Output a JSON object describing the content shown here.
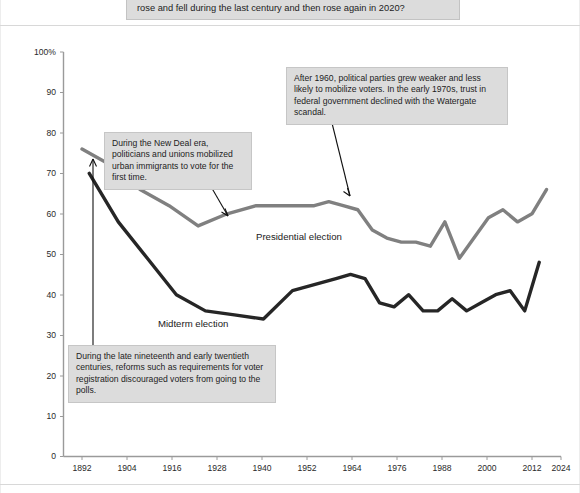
{
  "header": {
    "question": "rose and fell during the last century and then rose again in 2020?"
  },
  "colors": {
    "presidential_line": "#808080",
    "midterm_line": "#262626",
    "axis": "#9a9a9a",
    "callout_background": "#dcdcdc",
    "callout_border": "#c6c6c6",
    "annotation_arrow": "#111111"
  },
  "series_labels": {
    "presidential": "Presidential election",
    "midterm": "Midterm election"
  },
  "annotations": [
    {
      "id": "new-deal",
      "text": "During the New Deal era, politicians and unions mobilized urban immigrants to vote for the first time."
    },
    {
      "id": "parties-weaker",
      "text": "After 1960, political parties grew weaker and less likely to mobilize voters. In the early 1970s, trust in federal government declined with the Watergate scandal."
    },
    {
      "id": "registration-reforms",
      "text": "During the late nineteenth and early twentieth centuries, reforms such as requirements for voter registration discouraged voters from going to the polls."
    }
  ],
  "chart_data": {
    "type": "line",
    "title": "",
    "xlabel": "",
    "ylabel": "",
    "grid": false,
    "legend_position": "inline-labels",
    "xlim": [
      1892,
      2024
    ],
    "ylim": [
      0,
      100
    ],
    "ytick_labels": [
      "0",
      "10",
      "20",
      "30",
      "40",
      "50",
      "60",
      "70",
      "80",
      "90",
      "100%"
    ],
    "ytick_values": [
      0,
      10,
      20,
      30,
      40,
      50,
      60,
      70,
      80,
      90,
      100
    ],
    "xtick_labels": [
      "1892",
      "1904",
      "1916",
      "1928",
      "1940",
      "1952",
      "1964",
      "1976",
      "1988",
      "2000",
      "2012",
      "2024"
    ],
    "xtick_values": [
      1892,
      1904,
      1916,
      1928,
      1940,
      1952,
      1964,
      1976,
      1988,
      2000,
      2012,
      2024
    ],
    "series": [
      {
        "name": "Presidential election",
        "color": "#808080",
        "x": [
          1892,
          1900,
          1908,
          1916,
          1924,
          1932,
          1940,
          1948,
          1956,
          1960,
          1964,
          1968,
          1972,
          1976,
          1980,
          1984,
          1988,
          1992,
          1996,
          2000,
          2004,
          2008,
          2012,
          2016,
          2020
        ],
        "values": [
          76,
          72,
          66,
          62,
          57,
          60,
          62,
          62,
          62,
          63,
          62,
          61,
          56,
          54,
          53,
          53,
          52,
          58,
          49,
          54,
          59,
          61,
          58,
          60,
          66
        ]
      },
      {
        "name": "Midterm election",
        "color": "#262626",
        "x": [
          1894,
          1902,
          1910,
          1918,
          1926,
          1934,
          1942,
          1950,
          1958,
          1962,
          1966,
          1970,
          1974,
          1978,
          1982,
          1986,
          1990,
          1994,
          1998,
          2002,
          2006,
          2010,
          2014,
          2018
        ],
        "values": [
          70,
          58,
          49,
          40,
          36,
          35,
          34,
          41,
          43,
          44,
          45,
          44,
          38,
          37,
          40,
          36,
          36,
          39,
          36,
          38,
          40,
          41,
          36,
          48
        ]
      }
    ]
  }
}
